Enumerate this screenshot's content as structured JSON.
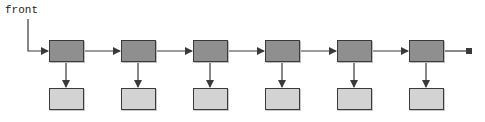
{
  "diagram": {
    "type": "singly-linked-list",
    "head_label": "front",
    "node_count": 6,
    "terminator": "null-marker",
    "colors": {
      "node_fill": "#8f8f8f",
      "data_fill": "#d3d3d3",
      "stroke": "#3a3a3a"
    }
  }
}
